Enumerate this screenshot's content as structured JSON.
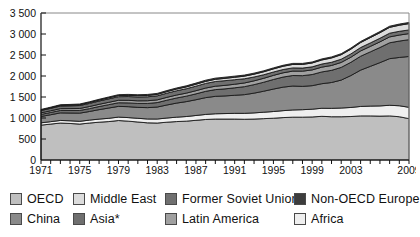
{
  "chart_data": {
    "type": "area",
    "stacked": true,
    "title": "",
    "subtitle": "",
    "xlabel": "",
    "ylabel": "",
    "xlim": [
      1971,
      2009
    ],
    "ylim": [
      0,
      3500
    ],
    "ytick_step": 500,
    "grid": false,
    "legend_position": "bottom",
    "note": "Asia*",
    "x": [
      1971,
      1972,
      1973,
      1974,
      1975,
      1976,
      1977,
      1978,
      1979,
      1980,
      1981,
      1982,
      1983,
      1984,
      1985,
      1986,
      1987,
      1988,
      1989,
      1990,
      1991,
      1992,
      1993,
      1994,
      1995,
      1996,
      1997,
      1998,
      1999,
      2000,
      2001,
      2002,
      2003,
      2004,
      2005,
      2006,
      2007,
      2008,
      2009
    ],
    "xtick_labels": [
      "1971",
      "1975",
      "1979",
      "1983",
      "1987",
      "1991",
      "1995",
      "1999",
      "2003",
      "2009"
    ],
    "ytick_labels": [
      "0",
      "500",
      "1 000",
      "1 500",
      "2 000",
      "2 500",
      "3 000",
      "3 500"
    ],
    "series": [
      {
        "name": "OECD",
        "color": "#bfbfbf",
        "values": [
          830,
          855,
          880,
          870,
          855,
          880,
          900,
          915,
          940,
          925,
          905,
          885,
          880,
          900,
          915,
          925,
          945,
          965,
          975,
          975,
          975,
          970,
          975,
          985,
          995,
          1010,
          1020,
          1020,
          1025,
          1040,
          1030,
          1030,
          1035,
          1050,
          1050,
          1045,
          1050,
          1030,
          985
        ]
      },
      {
        "name": "Africa",
        "color": "#efefef",
        "values": [
          55,
          58,
          62,
          64,
          66,
          70,
          74,
          78,
          82,
          85,
          88,
          92,
          96,
          100,
          105,
          110,
          115,
          120,
          126,
          131,
          136,
          141,
          147,
          153,
          159,
          165,
          172,
          178,
          185,
          192,
          200,
          208,
          216,
          225,
          234,
          243,
          253,
          262,
          270
        ]
      },
      {
        "name": "China",
        "color": "#8a8a8a",
        "values": [
          150,
          165,
          180,
          185,
          195,
          205,
          225,
          245,
          255,
          260,
          260,
          270,
          285,
          310,
          335,
          355,
          375,
          400,
          415,
          420,
          430,
          445,
          470,
          500,
          535,
          560,
          570,
          555,
          560,
          585,
          615,
          665,
          760,
          865,
          945,
          1030,
          1110,
          1150,
          1210
        ]
      },
      {
        "name": "Asia*",
        "color": "#6f6f6f",
        "values": [
          50,
          54,
          58,
          60,
          64,
          68,
          74,
          80,
          86,
          90,
          94,
          100,
          106,
          114,
          122,
          130,
          140,
          150,
          160,
          168,
          178,
          190,
          202,
          214,
          228,
          240,
          250,
          255,
          265,
          280,
          290,
          302,
          315,
          330,
          345,
          360,
          378,
          390,
          400
        ]
      },
      {
        "name": "Latin America",
        "color": "#a0a0a0",
        "values": [
          38,
          40,
          43,
          45,
          47,
          50,
          53,
          56,
          59,
          61,
          62,
          64,
          65,
          68,
          70,
          72,
          75,
          78,
          81,
          83,
          85,
          88,
          91,
          94,
          98,
          101,
          105,
          107,
          110,
          114,
          116,
          118,
          121,
          126,
          130,
          135,
          140,
          143,
          145
        ]
      },
      {
        "name": "Former Soviet Union",
        "color": "#707070",
        "values": [
          55,
          58,
          62,
          66,
          70,
          74,
          78,
          82,
          86,
          90,
          92,
          94,
          96,
          99,
          102,
          105,
          108,
          110,
          112,
          112,
          108,
          100,
          92,
          84,
          80,
          78,
          76,
          74,
          73,
          74,
          76,
          77,
          79,
          81,
          83,
          86,
          88,
          89,
          87
        ]
      },
      {
        "name": "Middle East",
        "color": "#dcdcdc",
        "values": [
          12,
          13,
          15,
          16,
          18,
          20,
          22,
          24,
          26,
          28,
          30,
          32,
          34,
          37,
          40,
          43,
          46,
          49,
          52,
          55,
          58,
          62,
          66,
          70,
          74,
          78,
          83,
          87,
          92,
          97,
          102,
          107,
          113,
          119,
          126,
          132,
          139,
          145,
          150
        ]
      },
      {
        "name": "Non-OECD Europe",
        "color": "#3d3d3d",
        "values": [
          14,
          15,
          16,
          17,
          18,
          19,
          20,
          21,
          22,
          23,
          23,
          24,
          24,
          25,
          26,
          26,
          27,
          28,
          28,
          28,
          27,
          26,
          25,
          24,
          24,
          24,
          24,
          24,
          24,
          25,
          25,
          25,
          26,
          26,
          27,
          27,
          28,
          28,
          28
        ]
      }
    ]
  },
  "legend": {
    "items": [
      {
        "label": "OECD",
        "color": "#bfbfbf",
        "row": 0,
        "x": 10
      },
      {
        "label": "Middle East",
        "color": "#dcdcdc",
        "row": 0,
        "x": 73
      },
      {
        "label": "Former Soviet Union",
        "color": "#707070",
        "row": 0,
        "x": 165
      },
      {
        "label": "Non-OECD Europe",
        "color": "#3d3d3d",
        "row": 0,
        "x": 294
      },
      {
        "label": "China",
        "color": "#8a8a8a",
        "row": 1,
        "x": 10
      },
      {
        "label": "Asia*",
        "color": "#6f6f6f",
        "row": 1,
        "x": 73
      },
      {
        "label": "Latin America",
        "color": "#a0a0a0",
        "row": 1,
        "x": 165
      },
      {
        "label": "Africa",
        "color": "#efefef",
        "row": 1,
        "x": 294
      }
    ]
  }
}
